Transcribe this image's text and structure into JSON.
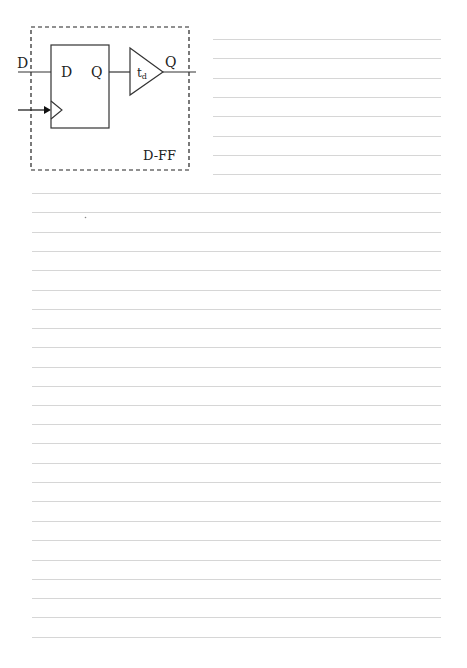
{
  "diagram": {
    "title": "D-FF",
    "input_label": "D",
    "output_label": "Q",
    "flipflop": {
      "d_pin_label": "D",
      "q_pin_label": "Q"
    },
    "delay_buffer": {
      "label_main": "t",
      "label_sub": "d"
    }
  },
  "ruled_paper": {
    "short_lines_count": 9,
    "full_lines_count": 24,
    "line_color": "#d8d8d8"
  }
}
